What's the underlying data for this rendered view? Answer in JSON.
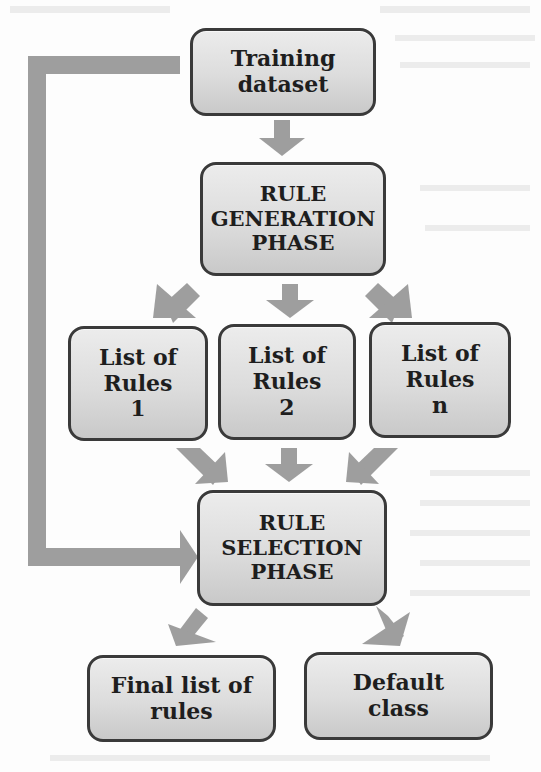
{
  "diagram": {
    "type": "flowchart",
    "nodes": {
      "training": {
        "label": "Training\ndataset"
      },
      "generation": {
        "label": "RULE\nGENERATION\nPHASE"
      },
      "rules1": {
        "label": "List of\nRules\n1"
      },
      "rules2": {
        "label": "List of\nRules\n2"
      },
      "rulesn": {
        "label": "List of\nRules\nn"
      },
      "selection": {
        "label": "RULE\nSELECTION\nPHASE"
      },
      "final": {
        "label": "Final list of\nrules"
      },
      "default": {
        "label": "Default\nclass"
      }
    },
    "edges": [
      {
        "from": "Training dataset",
        "to": "RULE GENERATION PHASE"
      },
      {
        "from": "RULE GENERATION PHASE",
        "to": "List of Rules 1"
      },
      {
        "from": "RULE GENERATION PHASE",
        "to": "List of Rules 2"
      },
      {
        "from": "RULE GENERATION PHASE",
        "to": "List of Rules n"
      },
      {
        "from": "List of Rules 1",
        "to": "RULE SELECTION PHASE"
      },
      {
        "from": "List of Rules 2",
        "to": "RULE SELECTION PHASE"
      },
      {
        "from": "List of Rules n",
        "to": "RULE SELECTION PHASE"
      },
      {
        "from": "Training dataset",
        "to": "RULE SELECTION PHASE"
      },
      {
        "from": "RULE SELECTION PHASE",
        "to": "Final list of rules"
      },
      {
        "from": "RULE SELECTION PHASE",
        "to": "Default class"
      }
    ],
    "colors": {
      "box_border": "#3a3a3a",
      "box_fill_top": "#ececec",
      "box_fill_bottom": "#c9c9c9",
      "arrow": "#9e9e9e",
      "text": "#1e1e1e"
    }
  }
}
